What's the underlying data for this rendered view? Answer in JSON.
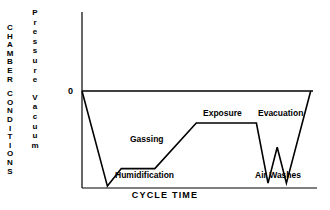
{
  "chart_data": {
    "type": "line",
    "title": "",
    "xlabel": "CYCLE TIME",
    "ylabel_top": "Pressure",
    "ylabel_bottom": "Vacuum",
    "y_axis_group_label": "CHAMBER CONDITIONS",
    "y_tick_labels": [
      "0"
    ],
    "y_zero_label": "0",
    "grid": false,
    "legend": "none",
    "axis_color": "#000000",
    "line_color": "#000000",
    "background_color": "#ffffff",
    "axis_ranges": {
      "x": [
        0,
        100
      ],
      "y_vacuum_relative": [
        0,
        100
      ]
    },
    "series": [
      {
        "name": "Chamber pressure / vacuum profile",
        "points": [
          {
            "x": 0,
            "y": 0,
            "stage": "start at 0 (atmospheric)"
          },
          {
            "x": 11.0,
            "y": 98,
            "stage": "initial evacuation trough"
          },
          {
            "x": 17.0,
            "y": 80,
            "stage": "humidification start"
          },
          {
            "x": 31.5,
            "y": 80,
            "stage": "humidification plateau end"
          },
          {
            "x": 49.5,
            "y": 33,
            "stage": "gassing rise complete"
          },
          {
            "x": 75.5,
            "y": 33,
            "stage": "exposure plateau end"
          },
          {
            "x": 80.5,
            "y": 95,
            "stage": "evacuation / first air wash trough"
          },
          {
            "x": 84.5,
            "y": 58,
            "stage": "air wash peak"
          },
          {
            "x": 88.5,
            "y": 95,
            "stage": "second air wash trough"
          },
          {
            "x": 99.0,
            "y": 0,
            "stage": "return to atmospheric"
          }
        ]
      }
    ],
    "annotations": [
      {
        "text": "Gassing",
        "x": 38,
        "y": 48
      },
      {
        "text": "Humidification",
        "x": 33,
        "y": 85
      },
      {
        "text": "Exposure",
        "x": 63,
        "y": 20
      },
      {
        "text": "Evacuation",
        "x": 87,
        "y": 20
      },
      {
        "text": "Air Washes",
        "x": 85,
        "y": 85
      }
    ]
  },
  "axes": {
    "x_label": "CYCLE TIME",
    "zero_label": "0"
  },
  "left_labels": {
    "group": "CHAMBER CONDITIONS",
    "group_line_1": "CHAMBER",
    "group_line_2": "CONDITIONS",
    "measure_line_1": "Pressure",
    "measure_line_2": "Vacuum"
  },
  "annotations": {
    "gassing": "Gassing",
    "humidification": "Humidification",
    "exposure": "Exposure",
    "evacuation": "Evacuation",
    "air_washes": "Air Washes"
  }
}
